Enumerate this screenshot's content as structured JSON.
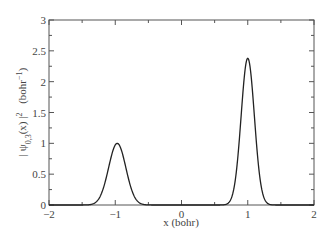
{
  "chart_data": {
    "type": "line",
    "title": "",
    "xlabel": "x (bohr)",
    "ylabel": "| ψ0,3(x) |² (bohr⁻¹)",
    "ylabel_parts": {
      "psi": "| ψ",
      "sub": "0,3",
      "arg": "(x) |",
      "sup": "2",
      "unit": "(bohr",
      "unit_sup": "−1",
      "unit_close": ")"
    },
    "xlim": [
      -2,
      2
    ],
    "ylim": [
      0,
      3
    ],
    "xticks": [
      -2,
      -1,
      0,
      1,
      2
    ],
    "xtick_labels": [
      "−2",
      "−1",
      "0",
      "1",
      "2"
    ],
    "yticks": [
      0,
      0.5,
      1,
      1.5,
      2,
      2.5,
      3
    ],
    "ytick_labels": [
      "0",
      "0.5",
      "1",
      "1.5",
      "2",
      "2.5",
      "3"
    ],
    "grid": false,
    "legend": null,
    "series": [
      {
        "name": "|ψ0,3(x)|²",
        "color": "#222222",
        "peaks": [
          {
            "x": -0.97,
            "y": 1.0,
            "width": 0.13
          },
          {
            "x": 1.0,
            "y": 2.38,
            "width": 0.1
          }
        ],
        "x": [
          -2.0,
          -1.4,
          -1.3,
          -1.2,
          -1.1,
          -1.0,
          -0.97,
          -0.9,
          -0.8,
          -0.7,
          -0.6,
          -0.5,
          -0.3,
          0.0,
          0.3,
          0.5,
          0.6,
          0.7,
          0.8,
          0.9,
          1.0,
          1.1,
          1.2,
          1.3,
          1.4,
          2.0
        ],
        "values": [
          0.0,
          0.0,
          0.01,
          0.18,
          0.62,
          0.98,
          1.0,
          0.88,
          0.42,
          0.13,
          0.03,
          0.01,
          0.0,
          0.0,
          0.0,
          0.02,
          0.08,
          0.35,
          1.1,
          2.05,
          2.38,
          1.85,
          0.45,
          0.04,
          0.0,
          0.0
        ]
      }
    ]
  }
}
